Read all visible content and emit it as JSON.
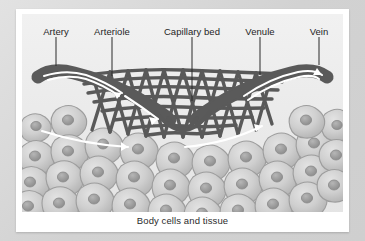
{
  "figure": {
    "caption": "Body cells and tissue",
    "background_color": "#ededed",
    "card_color": "#ffffff",
    "page_color": "#d8d8d8",
    "vessel_color": "#5a5a5a",
    "vessel_outline_color": "#3f3f3f",
    "flow_arrow_color": "#ffffff",
    "cell_fill_color": "#c9c9c9",
    "cell_outline_color": "#9a9a9a",
    "nucleus_color": "#9e9e9e",
    "leader_color": "#2a2a2a",
    "label_color": "#1e1e1e"
  },
  "labels": [
    {
      "id": "artery",
      "text": "Artery",
      "x": 50,
      "y": 22,
      "leader_x": 50,
      "leader_top": 32,
      "leader_height": 29
    },
    {
      "id": "arteriole",
      "text": "Arteriole",
      "x": 106,
      "y": 22,
      "leader_x": 106,
      "leader_top": 32,
      "leader_height": 39
    },
    {
      "id": "capillary-bed",
      "text": "Capillary bed",
      "x": 186,
      "y": 22,
      "leader_x": 186,
      "leader_top": 32,
      "leader_height": 64
    },
    {
      "id": "venule",
      "text": "Venule",
      "x": 254,
      "y": 22,
      "leader_x": 254,
      "leader_top": 32,
      "leader_height": 38
    },
    {
      "id": "vein",
      "text": "Vein",
      "x": 313,
      "y": 22,
      "leader_x": 313,
      "leader_top": 32,
      "leader_height": 28
    }
  ],
  "flow_arrows": [
    {
      "id": "artery-inflow",
      "direction": "down-right",
      "description": "Blood flows from artery into arteriole"
    },
    {
      "id": "arteriole-flow",
      "direction": "right",
      "description": "Blood enters capillary bed"
    },
    {
      "id": "venule-flow",
      "direction": "right-up",
      "description": "Blood leaves capillary bed into venule"
    },
    {
      "id": "vein-outflow",
      "direction": "up-right",
      "description": "Blood flows out through vein"
    }
  ]
}
